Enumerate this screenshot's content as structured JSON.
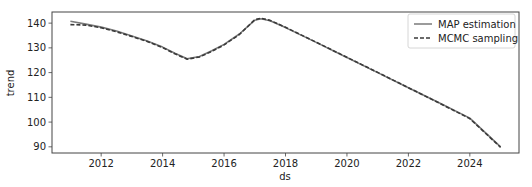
{
  "chart_data": {
    "type": "line",
    "title": "",
    "xlabel": "ds",
    "ylabel": "trend",
    "xlim": [
      2010.4,
      2025.6
    ],
    "ylim": [
      87.5,
      144.5
    ],
    "grid": false,
    "legend_position": "upper right",
    "x_ticks": [
      2012,
      2014,
      2016,
      2018,
      2020,
      2022,
      2024
    ],
    "y_ticks": [
      90,
      100,
      110,
      120,
      130,
      140
    ],
    "series": [
      {
        "name": "MAP estimation",
        "style": "solid",
        "color": "#7a7a7a",
        "x": [
          2011.0,
          2011.5,
          2012.0,
          2012.5,
          2013.0,
          2013.5,
          2014.0,
          2014.4,
          2014.8,
          2015.2,
          2015.6,
          2016.0,
          2016.5,
          2017.0,
          2017.2,
          2017.5,
          2018.0,
          2019.0,
          2020.0,
          2021.0,
          2022.0,
          2023.0,
          2024.0,
          2025.0
        ],
        "values": [
          140.8,
          139.6,
          138.4,
          136.8,
          134.8,
          132.8,
          130.3,
          127.8,
          125.6,
          126.5,
          128.8,
          131.4,
          135.6,
          141.2,
          141.8,
          141.0,
          138.2,
          132.2,
          126.1,
          120.0,
          113.9,
          107.8,
          101.6,
          90.0
        ]
      },
      {
        "name": "MCMC sampling",
        "style": "dashed",
        "color": "#3a3a3a",
        "x": [
          2011.0,
          2011.5,
          2012.0,
          2012.5,
          2013.0,
          2013.5,
          2014.0,
          2014.4,
          2014.8,
          2015.2,
          2015.6,
          2016.0,
          2016.5,
          2017.0,
          2017.2,
          2017.5,
          2018.0,
          2019.0,
          2020.0,
          2021.0,
          2022.0,
          2023.0,
          2024.0,
          2025.0
        ],
        "values": [
          139.4,
          139.2,
          138.1,
          136.5,
          134.6,
          132.6,
          130.1,
          127.6,
          125.4,
          126.3,
          128.6,
          131.2,
          135.4,
          141.4,
          142.0,
          141.1,
          138.3,
          132.3,
          126.2,
          120.1,
          113.9,
          107.7,
          101.4,
          89.8
        ]
      }
    ]
  },
  "legend": {
    "items": [
      {
        "label": "MAP estimation"
      },
      {
        "label": "MCMC sampling"
      }
    ]
  },
  "axes": {
    "xlabel": "ds",
    "ylabel": "trend",
    "x_tick_labels": [
      "2012",
      "2014",
      "2016",
      "2018",
      "2020",
      "2022",
      "2024"
    ],
    "y_tick_labels": [
      "90",
      "100",
      "110",
      "120",
      "130",
      "140"
    ]
  },
  "colors": {
    "map_line": "#7a7a7a",
    "mcmc_line": "#3a3a3a",
    "frame": "#444444",
    "legend_border": "#cccccc"
  }
}
